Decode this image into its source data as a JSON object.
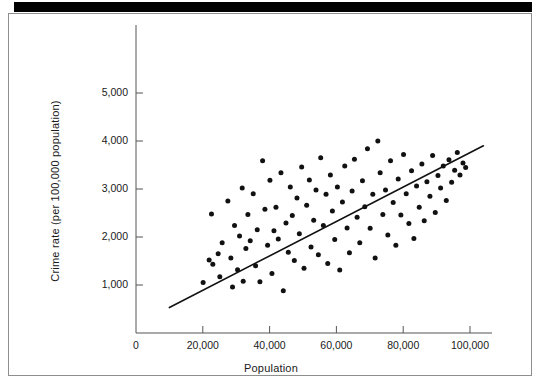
{
  "chart_data": {
    "type": "scatter",
    "title": "",
    "xlabel": "Population",
    "ylabel": "Crime rate (per 100,000 population)",
    "xlim": [
      0,
      105000
    ],
    "ylim": [
      0,
      5400
    ],
    "grid": false,
    "legend": null,
    "xticks": [
      0,
      20000,
      40000,
      60000,
      80000,
      100000
    ],
    "xtick_labels": [
      "0",
      "20,000",
      "40,000",
      "60,000",
      "80,000",
      "100,000"
    ],
    "yticks": [
      1000,
      2000,
      3000,
      4000,
      5000
    ],
    "ytick_labels": [
      "1,000",
      "2,000",
      "3,000",
      "4,000",
      "5,000"
    ],
    "marker": "filled-circle",
    "marker_color": "#111111",
    "marker_size_px": 5,
    "trendline": {
      "type": "linear-fit",
      "color": "#111111",
      "width_px": 1.6,
      "x_start": 10000,
      "y_start": 530,
      "x_end": 104000,
      "y_end": 3900
    },
    "points": [
      [
        20100,
        1050
      ],
      [
        21900,
        1520
      ],
      [
        22600,
        2480
      ],
      [
        23000,
        1430
      ],
      [
        24600,
        1650
      ],
      [
        25100,
        1170
      ],
      [
        25800,
        1880
      ],
      [
        27500,
        2750
      ],
      [
        28400,
        1560
      ],
      [
        28900,
        960
      ],
      [
        29500,
        2240
      ],
      [
        30400,
        1320
      ],
      [
        31000,
        2020
      ],
      [
        31800,
        3020
      ],
      [
        32100,
        1080
      ],
      [
        32900,
        1760
      ],
      [
        33500,
        2470
      ],
      [
        34200,
        1920
      ],
      [
        35100,
        2900
      ],
      [
        35800,
        1400
      ],
      [
        36300,
        2150
      ],
      [
        37100,
        1070
      ],
      [
        37900,
        3590
      ],
      [
        38600,
        2580
      ],
      [
        39400,
        1830
      ],
      [
        40100,
        3180
      ],
      [
        40700,
        1240
      ],
      [
        41300,
        2130
      ],
      [
        41900,
        2620
      ],
      [
        42600,
        1960
      ],
      [
        43400,
        3340
      ],
      [
        44100,
        880
      ],
      [
        44900,
        2290
      ],
      [
        45600,
        1680
      ],
      [
        46200,
        3040
      ],
      [
        46800,
        2450
      ],
      [
        47400,
        1510
      ],
      [
        48200,
        2810
      ],
      [
        48900,
        2070
      ],
      [
        49600,
        3460
      ],
      [
        50300,
        1350
      ],
      [
        51100,
        2660
      ],
      [
        51900,
        3190
      ],
      [
        52400,
        1790
      ],
      [
        53200,
        2350
      ],
      [
        53900,
        2980
      ],
      [
        54600,
        1630
      ],
      [
        55300,
        3650
      ],
      [
        56100,
        2240
      ],
      [
        56900,
        2890
      ],
      [
        57400,
        1450
      ],
      [
        58200,
        3290
      ],
      [
        58800,
        2540
      ],
      [
        59500,
        1950
      ],
      [
        60300,
        3040
      ],
      [
        61000,
        1310
      ],
      [
        61800,
        2730
      ],
      [
        62500,
        3480
      ],
      [
        63200,
        2190
      ],
      [
        63900,
        1670
      ],
      [
        64700,
        2960
      ],
      [
        65400,
        3620
      ],
      [
        66200,
        2410
      ],
      [
        67000,
        1880
      ],
      [
        67800,
        3170
      ],
      [
        68500,
        2630
      ],
      [
        69300,
        3840
      ],
      [
        70100,
        2180
      ],
      [
        70900,
        2890
      ],
      [
        71600,
        1560
      ],
      [
        72400,
        4000
      ],
      [
        73100,
        3340
      ],
      [
        73900,
        2470
      ],
      [
        74700,
        2980
      ],
      [
        75400,
        2040
      ],
      [
        76200,
        3590
      ],
      [
        77000,
        2720
      ],
      [
        77800,
        1830
      ],
      [
        78500,
        3210
      ],
      [
        79300,
        2460
      ],
      [
        80100,
        3720
      ],
      [
        80900,
        2900
      ],
      [
        81700,
        2280
      ],
      [
        82500,
        3380
      ],
      [
        83200,
        1970
      ],
      [
        84000,
        3060
      ],
      [
        84800,
        2620
      ],
      [
        85600,
        3520
      ],
      [
        86300,
        2340
      ],
      [
        87100,
        3150
      ],
      [
        88000,
        2850
      ],
      [
        88800,
        3700
      ],
      [
        89600,
        2510
      ],
      [
        90400,
        3280
      ],
      [
        91200,
        3020
      ],
      [
        92000,
        3480
      ],
      [
        92900,
        2760
      ],
      [
        93700,
        3610
      ],
      [
        94500,
        3140
      ],
      [
        95400,
        3390
      ],
      [
        96200,
        3760
      ],
      [
        97000,
        3290
      ],
      [
        97900,
        3540
      ],
      [
        98700,
        3450
      ]
    ]
  }
}
